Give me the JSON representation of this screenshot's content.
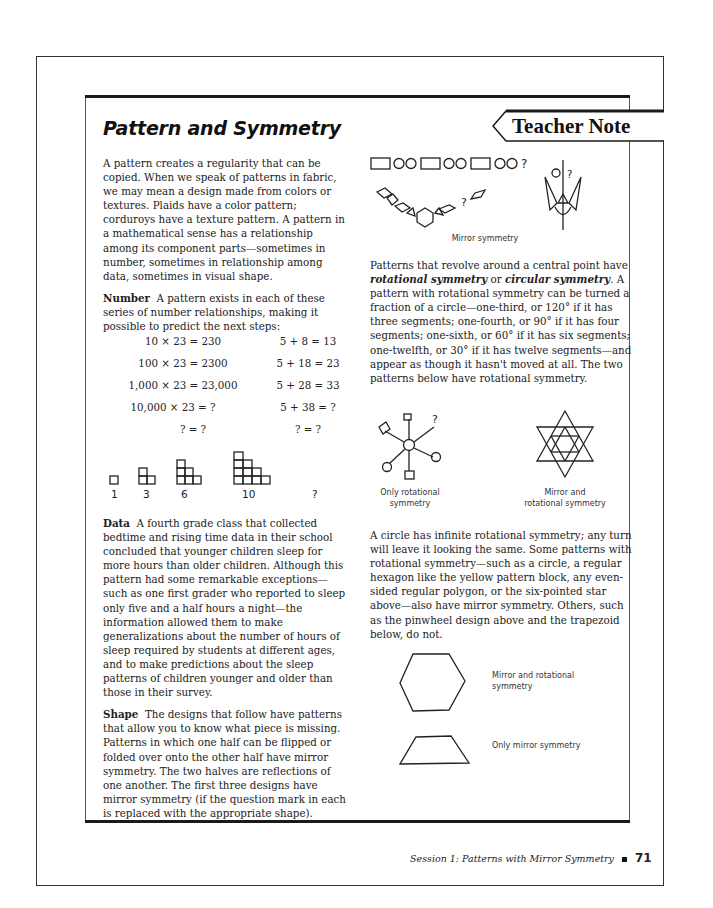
{
  "page": {
    "title": "Pattern and Symmetry",
    "tab_label": "Teacher Note",
    "footer": {
      "session": "Session 1: Patterns with Mirror Symmetry",
      "page_number": "71"
    }
  },
  "left_column": {
    "intro": "A pattern creates a regularity that can be copied. When we speak of patterns in fabric, we may mean a design made from colors or textures. Plaids have a color pattern; corduroys have a texture pattern. A pattern in a mathematical sense has a relationship among its component parts—sometimes in number, sometimes in relationship among data, sometimes in visual shape.",
    "number_heading": "Number",
    "number_text": "A pattern exists in each of these series of number relationships, making it possible to predict the next steps:",
    "equations": [
      {
        "left": "10 × 23 = 230",
        "right": "5 + 8 = 13"
      },
      {
        "left": "100 × 23 = 2300",
        "right": "5 + 18 = 23"
      },
      {
        "left": "1,000 × 23 = 23,000",
        "right": "5 + 28 = 33"
      },
      {
        "left": "10,000 × 23 = ?",
        "right": "5 + 38 = ?"
      },
      {
        "left": "? = ?",
        "right": "? = ?"
      }
    ],
    "triangular_numbers": [
      "1",
      "3",
      "6",
      "10",
      "?"
    ],
    "data_heading": "Data",
    "data_text": "A fourth grade class that collected bedtime and rising time data in their school concluded that younger children sleep for more hours than older children. Although this pattern had some remarkable exceptions—such as one first grader who reported to sleep only five and a half hours a night—the information allowed them to make generalizations about the number of hours of sleep required by students at different ages, and to make predictions about the sleep patterns of children younger and older than those in their survey.",
    "shape_heading": "Shape",
    "shape_text": "The designs that follow have patterns that allow you to know what piece is missing. Patterns in which one half can be flipped or folded over onto the other half have mirror symmetry. The two halves are reflections of one another. The first three designs have mirror symmetry (if the question mark in each is replaced with the appropriate shape)."
  },
  "right_column": {
    "sequence_question": "?",
    "chain_question": "?",
    "trident_question": "?",
    "mirror_caption": "Mirror symmetry",
    "rotational_text_1": "Patterns that revolve around a central point have ",
    "rotational_em_1": "rotational symmetry",
    "rotational_text_2": " or ",
    "rotational_em_2": "circular symmetry",
    "rotational_text_3": ". A pattern with rotational symmetry can be turned a fraction of a circle—one-third, or 120° if it has three segments; one-fourth, or 90° if it has four segments; one-sixth, or 60° if it has six segments; one-twelfth, or 30° if it has twelve segments—and appear as though it hasn't moved at all. The two patterns below have rotational symmetry.",
    "pinwheel_question": "?",
    "pinwheel_caption_1": "Only rotational",
    "pinwheel_caption_2": "symmetry",
    "star_caption_1": "Mirror and",
    "star_caption_2": "rotational symmetry",
    "circle_text": "A circle has infinite rotational symmetry; any turn will leave it looking the same. Some patterns with rotational symmetry—such as a circle, a regular hexagon like the yellow pattern block, any even-sided regular polygon, or the six-pointed star above—also have mirror symmetry. Others, such as the pinwheel design above and the trapezoid below, do not.",
    "hexagon_caption_1": "Mirror and rotational",
    "hexagon_caption_2": "symmetry",
    "trapezoid_caption": "Only mirror symmetry"
  }
}
